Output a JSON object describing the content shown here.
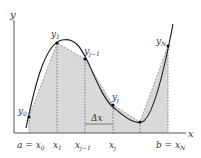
{
  "axes": {
    "x_label": "x",
    "y_label": "y"
  },
  "colors": {
    "fill": "#d9d9d9",
    "curve": "#222222",
    "axis": "#555555",
    "dashed": "#666666"
  },
  "points": [
    {
      "name": "y0",
      "label": "y",
      "sub": "0",
      "x": 29,
      "y": 117
    },
    {
      "name": "y1",
      "label": "y",
      "sub": "1",
      "x": 57,
      "y": 43
    },
    {
      "name": "yj-1",
      "label": "y",
      "sub": "j−1",
      "x": 85,
      "y": 59
    },
    {
      "name": "yj",
      "label": "y",
      "sub": "j",
      "x": 113,
      "y": 105
    },
    {
      "name": "yj+1",
      "label": "",
      "sub": "",
      "x": 140,
      "y": 122
    },
    {
      "name": "yN",
      "label": "y",
      "sub": "N",
      "x": 168,
      "y": 46
    }
  ],
  "x_ticks": [
    {
      "label": "a = x",
      "sub": "0"
    },
    {
      "label": "x",
      "sub": "1"
    },
    {
      "label": "x",
      "sub": "j−1"
    },
    {
      "label": "x",
      "sub": "j"
    },
    {
      "label": "",
      "sub": ""
    },
    {
      "label": "b = x",
      "sub": "N"
    }
  ],
  "delta_label": "Δx"
}
